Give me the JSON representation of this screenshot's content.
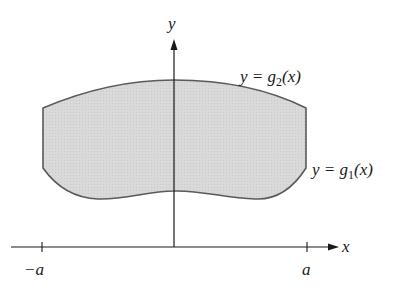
{
  "diagram": {
    "type": "region-between-curves",
    "axes": {
      "x_label": "x",
      "y_label": "y",
      "ticks": [
        {
          "label": "−a",
          "position": "left"
        },
        {
          "label": "a",
          "position": "right"
        }
      ]
    },
    "curves": {
      "upper": {
        "label_prefix": "y = g",
        "subscript": "2",
        "label_suffix": "(x)"
      },
      "lower": {
        "label_prefix": "y = g",
        "subscript": "1",
        "label_suffix": "(x)"
      }
    },
    "colors": {
      "region_fill": "#d6d6d6",
      "region_stroke": "#5a5a5a",
      "axis": "#1a1a1a"
    }
  }
}
